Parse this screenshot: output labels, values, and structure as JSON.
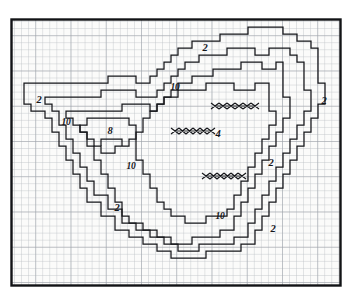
{
  "figure": {
    "kind": "hand-drawn contour map on graph paper",
    "background_color": "#ffffff",
    "paper_color": "#fbfbfa",
    "grid_color": "#b9bcc2",
    "grid_major_color": "#9a9ea6",
    "ink_color": "#15161a",
    "frame_color": "#121316",
    "plate": {
      "x": 11,
      "y": 19,
      "width": 330,
      "height": 267
    },
    "grid": {
      "cell": 7.05,
      "major_every": 5
    }
  },
  "chart_data": {
    "type": "contour",
    "title": "",
    "xlabel": "",
    "ylabel": "",
    "grid": true,
    "legend": "none",
    "contour_levels": [
      2,
      4,
      8,
      10
    ],
    "labels": [
      {
        "text": "2",
        "x": 205,
        "y": 48,
        "size": "lbl-md",
        "region": "top-center"
      },
      {
        "text": "10",
        "x": 175,
        "y": 88,
        "size": "lbl-sm",
        "region": "upper-center"
      },
      {
        "text": "2",
        "x": 39,
        "y": 100,
        "size": "lbl-md",
        "region": "left-outer"
      },
      {
        "text": "2",
        "x": 324,
        "y": 101,
        "size": "lbl-md",
        "region": "right-outer"
      },
      {
        "text": "10",
        "x": 66,
        "y": 123,
        "size": "lbl-sm",
        "region": "left-inner"
      },
      {
        "text": "8",
        "x": 110,
        "y": 131,
        "size": "lbl-md",
        "region": "left-core"
      },
      {
        "text": "4",
        "x": 218,
        "y": 134,
        "size": "lbl-md",
        "region": "center-core"
      },
      {
        "text": "10",
        "x": 131,
        "y": 167,
        "size": "lbl-sm",
        "region": "center-left"
      },
      {
        "text": "2",
        "x": 271,
        "y": 163,
        "size": "lbl-md",
        "region": "right-mid"
      },
      {
        "text": "2",
        "x": 117,
        "y": 208,
        "size": "lbl-md",
        "region": "lower-left"
      },
      {
        "text": "10",
        "x": 220,
        "y": 217,
        "size": "lbl-sm",
        "region": "lower-center"
      },
      {
        "text": "2",
        "x": 273,
        "y": 229,
        "size": "lbl-md",
        "region": "lower-right"
      }
    ],
    "hatch_marks": [
      {
        "name": "hatch-mark-upper",
        "x": 235,
        "y": 106,
        "width": 48,
        "links": 5
      },
      {
        "name": "hatch-mark-center",
        "x": 193,
        "y": 131,
        "width": 44,
        "links": 5
      },
      {
        "name": "hatch-mark-lower",
        "x": 224,
        "y": 176,
        "width": 44,
        "links": 5
      }
    ]
  }
}
